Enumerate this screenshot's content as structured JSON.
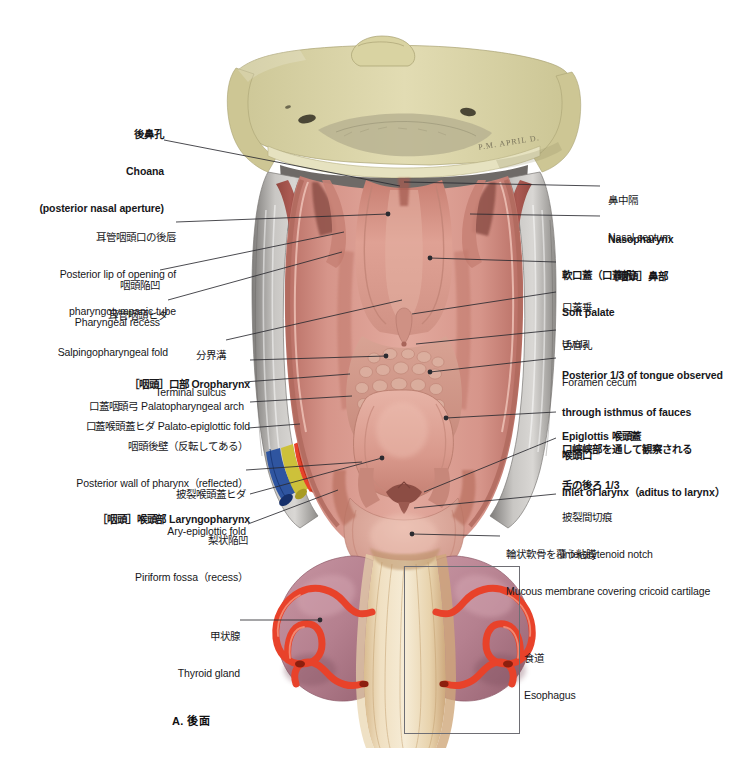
{
  "figure": {
    "caption": "A. 後面",
    "artist_signature": "P.M. APRIL D."
  },
  "colors": {
    "bone": "#d8d3a4",
    "bone_light": "#e9e6c8",
    "mucosa": "#d08f84",
    "mucosa_light": "#e0a99d",
    "muscle_red": "#a8413a",
    "thyroid": "#b5808f",
    "artery": "#e8422a",
    "vein": "#2f55a0",
    "nerve": "#ccc033",
    "esophagus": "#e5cfa8",
    "fascia_grey": "#b9b7b4",
    "leader": "#2b2b30",
    "text": "#17171a"
  },
  "labels_left": [
    {
      "id": "choana",
      "jp": "後鼻孔",
      "en": "Choana",
      "en2": "(posterior nasal aperture)",
      "bold": true
    },
    {
      "id": "posterior-lip-pharyngotympanic-tube",
      "jp": "耳管咽頭口の後唇",
      "en": "Posterior lip of opening of",
      "en2": "pharyngotympanic tube",
      "bold": false
    },
    {
      "id": "pharyngeal-recess",
      "jp": "咽頭陥凹",
      "en": "Pharyngeal recess",
      "bold": false
    },
    {
      "id": "salpingopharyngeal-fold",
      "jp": "耳管咽頭ヒダ",
      "en": "Salpingopharyngeal fold",
      "bold": false
    },
    {
      "id": "terminal-sulcus",
      "jp": "分界溝",
      "en": "Terminal sulcus",
      "bold": false
    },
    {
      "id": "oropharynx",
      "jp": "",
      "en": "［咽頭］口部 Oropharynx",
      "bold": true
    },
    {
      "id": "palatopharyngeal-arch",
      "jp": "",
      "en": "口蓋咽頭弓 Palatopharyngeal arch",
      "bold": false
    },
    {
      "id": "palato-epiglottic-fold",
      "jp": "",
      "en": "口蓋喉頭蓋ヒダ Palato-epiglottic fold",
      "bold": false
    },
    {
      "id": "posterior-wall-of-pharynx",
      "jp": "咽頭後壁（反転してある）",
      "en": "Posterior wall of pharynx（reflected）",
      "bold": false
    },
    {
      "id": "ary-epiglottic-fold",
      "jp": "披裂喉頭蓋ヒダ",
      "en": "Ary-epiglottic fold",
      "bold": false
    },
    {
      "id": "laryngopharynx",
      "jp": "",
      "en": "［咽頭］喉頭部 Laryngopharynx",
      "bold": true
    },
    {
      "id": "piriform-fossa",
      "jp": "梨状陥凹",
      "en": "Piriform fossa（recess）",
      "bold": false
    },
    {
      "id": "thyroid-gland",
      "jp": "甲状腺",
      "en": "Thyroid gland",
      "bold": false
    }
  ],
  "labels_right": [
    {
      "id": "nasal-septum",
      "jp": "鼻中隔",
      "en": "Nasal septum",
      "bold": false
    },
    {
      "id": "nasopharynx",
      "en": "Nasopharynx",
      "jp": "［咽頭］鼻部",
      "bold": true
    },
    {
      "id": "soft-palate",
      "jp": "軟口蓋（口蓋帆）",
      "en": "Soft palate",
      "bold": true
    },
    {
      "id": "uvula",
      "jp": "口蓋垂",
      "en": "Uvula",
      "bold": false
    },
    {
      "id": "foramen-cecum",
      "jp": "舌盲孔",
      "en": "Foramen cecum",
      "bold": false
    },
    {
      "id": "posterior-third-of-tongue",
      "en": "Posterior 1/3 of tongue observed",
      "en2": "through isthmus of fauces",
      "jp": "口峡峡部を通して観察される",
      "jp2": "舌の後ろ 1/3",
      "bold": true
    },
    {
      "id": "epiglottis",
      "en": "Epiglottis 喉頭蓋",
      "jp": "",
      "bold": true
    },
    {
      "id": "inlet-of-larynx",
      "jp": "喉頭口",
      "en": "Inlet of larynx（aditus to larynx）",
      "bold": true
    },
    {
      "id": "interarytenoid-notch",
      "jp": "披裂間切痕",
      "en": "Interarytenoid notch",
      "bold": false
    },
    {
      "id": "mucous-membrane-cricoid",
      "jp": "輪状軟骨を覆う粘膜",
      "en": "Mucous membrane covering cricoid cartilage",
      "bold": false
    },
    {
      "id": "esophagus",
      "jp": "食道",
      "en": "Esophagus",
      "bold": false
    }
  ]
}
